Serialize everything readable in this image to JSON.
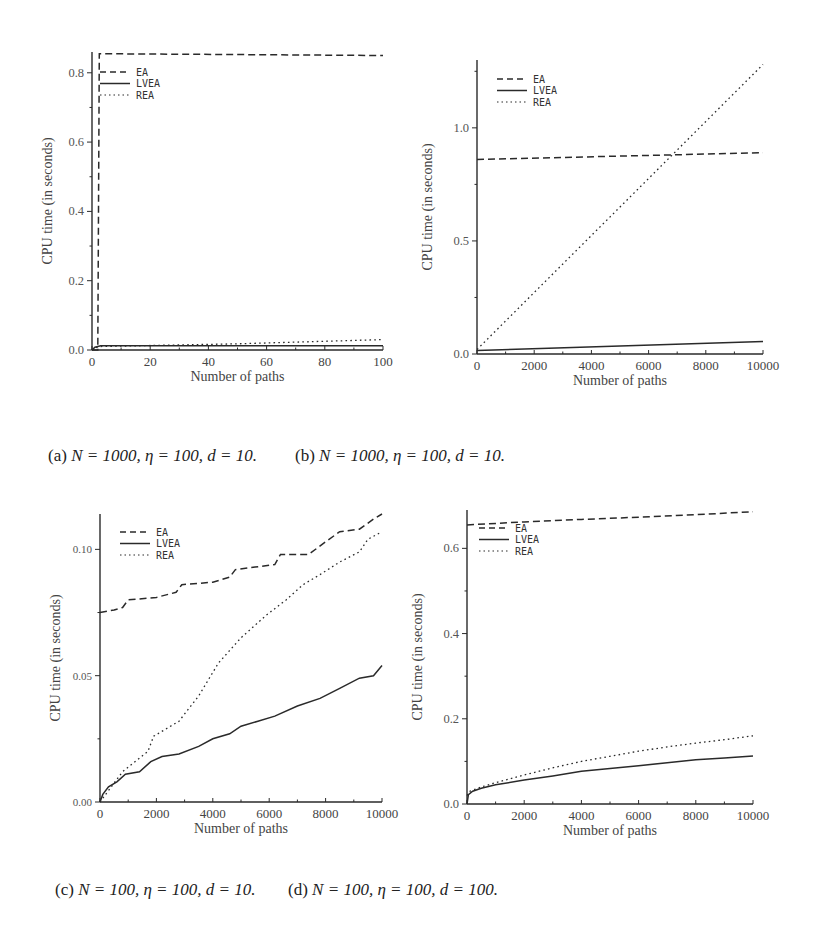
{
  "figure": {
    "captions": [
      {
        "label": "(a)",
        "text": "N = 1000, η = 100, d = 10."
      },
      {
        "label": "(b)",
        "text": "N = 1000, η = 100, d = 10."
      },
      {
        "label": "(c)",
        "text": "N = 100, η = 100, d = 10."
      },
      {
        "label": "(d)",
        "text": "N = 100, η = 100, d = 100."
      }
    ]
  },
  "chart_data": [
    {
      "type": "line",
      "title": "(a) N = 1000, η = 100, d = 10.",
      "xlabel": "Number of paths",
      "ylabel": "CPU time (in seconds)",
      "xlim": [
        0,
        100
      ],
      "ylim": [
        0,
        0.86
      ],
      "xticks": [
        0,
        20,
        40,
        60,
        80,
        100
      ],
      "xtick_labels": [
        "0",
        "20",
        "40",
        "60",
        "80",
        "100"
      ],
      "yticks": [
        0.0,
        0.2,
        0.4,
        0.6,
        0.8
      ],
      "ytick_labels": [
        "0.0",
        "0.2",
        "0.4",
        "0.6",
        "0.8"
      ],
      "legend": [
        "EA",
        "LVEA",
        "REA"
      ],
      "legend_position": "upper left",
      "box": {
        "x0": 92,
        "y0": 350,
        "x1": 383,
        "y1": 52
      },
      "series": [
        {
          "name": "EA",
          "style": "dashed",
          "x": [
            0,
            2,
            2.5,
            100
          ],
          "y": [
            0,
            0,
            0.855,
            0.85
          ]
        },
        {
          "name": "LVEA",
          "style": "solid",
          "x": [
            0,
            1,
            3,
            100
          ],
          "y": [
            0,
            0.008,
            0.012,
            0.012
          ]
        },
        {
          "name": "REA",
          "style": "dotted",
          "x": [
            0,
            1,
            3,
            50,
            100
          ],
          "y": [
            0,
            0.006,
            0.01,
            0.018,
            0.03
          ]
        }
      ]
    },
    {
      "type": "line",
      "title": "(b) N = 1000, η = 100, d = 10.",
      "xlabel": "Number of paths",
      "ylabel": "CPU time (in seconds)",
      "xlim": [
        0,
        10000
      ],
      "ylim": [
        0,
        1.3
      ],
      "xticks": [
        0,
        2000,
        4000,
        6000,
        8000,
        10000
      ],
      "xtick_labels": [
        "0",
        "2000",
        "4000",
        "6000",
        "8000",
        "10000"
      ],
      "yticks": [
        0.0,
        0.5,
        1.0
      ],
      "ytick_labels": [
        "0.0",
        "0.5",
        "1.0"
      ],
      "legend": [
        "EA",
        "LVEA",
        "REA"
      ],
      "legend_position": "upper left",
      "box": {
        "x0": 477,
        "y0": 354,
        "x1": 763,
        "y1": 60
      },
      "series": [
        {
          "name": "EA",
          "style": "dashed",
          "x": [
            0,
            10000
          ],
          "y": [
            0.86,
            0.89
          ]
        },
        {
          "name": "LVEA",
          "style": "solid",
          "x": [
            0,
            2500,
            5000,
            7500,
            10000
          ],
          "y": [
            0.015,
            0.025,
            0.035,
            0.045,
            0.055
          ]
        },
        {
          "name": "REA",
          "style": "dotted",
          "x": [
            0,
            10000
          ],
          "y": [
            0.02,
            1.28
          ]
        }
      ]
    },
    {
      "type": "line",
      "title": "(c) N = 100, η = 100, d = 10.",
      "xlabel": "Number of paths",
      "ylabel": "CPU time (in seconds)",
      "xlim": [
        0,
        10000
      ],
      "ylim": [
        0,
        0.114
      ],
      "xticks": [
        0,
        2000,
        4000,
        6000,
        8000,
        10000
      ],
      "xtick_labels": [
        "0",
        "2000",
        "4000",
        "6000",
        "8000",
        "10000"
      ],
      "yticks": [
        0.0,
        0.05,
        0.1
      ],
      "ytick_labels": [
        "0.00",
        "0.05",
        "0.10"
      ],
      "legend": [
        "EA",
        "LVEA",
        "REA"
      ],
      "legend_position": "upper left",
      "box": {
        "x0": 100,
        "y0": 802,
        "x1": 382,
        "y1": 514
      },
      "series": [
        {
          "name": "EA",
          "style": "dashed",
          "x": [
            0,
            500,
            800,
            1000,
            2000,
            2700,
            2900,
            4000,
            4600,
            4800,
            5500,
            6200,
            6400,
            7400,
            8000,
            8500,
            9200,
            9700,
            10000
          ],
          "y": [
            0.075,
            0.076,
            0.077,
            0.08,
            0.081,
            0.083,
            0.086,
            0.087,
            0.089,
            0.092,
            0.093,
            0.094,
            0.098,
            0.098,
            0.103,
            0.107,
            0.108,
            0.112,
            0.114
          ]
        },
        {
          "name": "LVEA",
          "style": "solid",
          "x": [
            0,
            100,
            300,
            600,
            900,
            1400,
            1800,
            2200,
            2800,
            3500,
            4000,
            4600,
            5000,
            5600,
            6200,
            7000,
            7800,
            8500,
            9200,
            9700,
            10000
          ],
          "y": [
            0,
            0.003,
            0.006,
            0.008,
            0.011,
            0.012,
            0.016,
            0.018,
            0.019,
            0.022,
            0.025,
            0.027,
            0.03,
            0.032,
            0.034,
            0.038,
            0.041,
            0.045,
            0.049,
            0.05,
            0.054
          ]
        },
        {
          "name": "REA",
          "style": "dotted",
          "x": [
            0,
            800,
            1700,
            1900,
            2800,
            3500,
            4200,
            5000,
            5900,
            6600,
            7200,
            7800,
            8500,
            9200,
            9500,
            10000
          ],
          "y": [
            0,
            0.012,
            0.02,
            0.026,
            0.032,
            0.042,
            0.055,
            0.065,
            0.074,
            0.08,
            0.086,
            0.09,
            0.095,
            0.099,
            0.104,
            0.107
          ]
        }
      ]
    },
    {
      "type": "line",
      "title": "(d) N = 100, η = 100, d = 100.",
      "xlabel": "Number of paths",
      "ylabel": "CPU time (in seconds)",
      "xlim": [
        0,
        10000
      ],
      "ylim": [
        0,
        0.69
      ],
      "xticks": [
        0,
        2000,
        4000,
        6000,
        8000,
        10000
      ],
      "xtick_labels": [
        "0",
        "2000",
        "4000",
        "6000",
        "8000",
        "10000"
      ],
      "yticks": [
        0.0,
        0.2,
        0.4,
        0.6
      ],
      "ytick_labels": [
        "0.0",
        "0.2",
        "0.4",
        "0.6"
      ],
      "legend": [
        "EA",
        "LVEA",
        "REA"
      ],
      "legend_position": "upper left",
      "box": {
        "x0": 467,
        "y0": 804,
        "x1": 753,
        "y1": 510
      },
      "series": [
        {
          "name": "EA",
          "style": "dashed",
          "x": [
            0,
            2000,
            4000,
            6000,
            8000,
            10000
          ],
          "y": [
            0.655,
            0.662,
            0.668,
            0.673,
            0.679,
            0.686
          ]
        },
        {
          "name": "LVEA",
          "style": "solid",
          "x": [
            0,
            50,
            200,
            500,
            1000,
            2000,
            3000,
            4000,
            5000,
            6000,
            7000,
            8000,
            9000,
            10000
          ],
          "y": [
            0,
            0.022,
            0.03,
            0.037,
            0.045,
            0.056,
            0.066,
            0.077,
            0.083,
            0.09,
            0.097,
            0.104,
            0.108,
            0.113
          ]
        },
        {
          "name": "REA",
          "style": "dotted",
          "x": [
            0,
            100,
            500,
            1000,
            2000,
            3000,
            4000,
            5000,
            6000,
            7000,
            8000,
            9000,
            10000
          ],
          "y": [
            0.02,
            0.03,
            0.04,
            0.05,
            0.068,
            0.085,
            0.1,
            0.112,
            0.124,
            0.134,
            0.143,
            0.151,
            0.16
          ]
        }
      ]
    }
  ]
}
